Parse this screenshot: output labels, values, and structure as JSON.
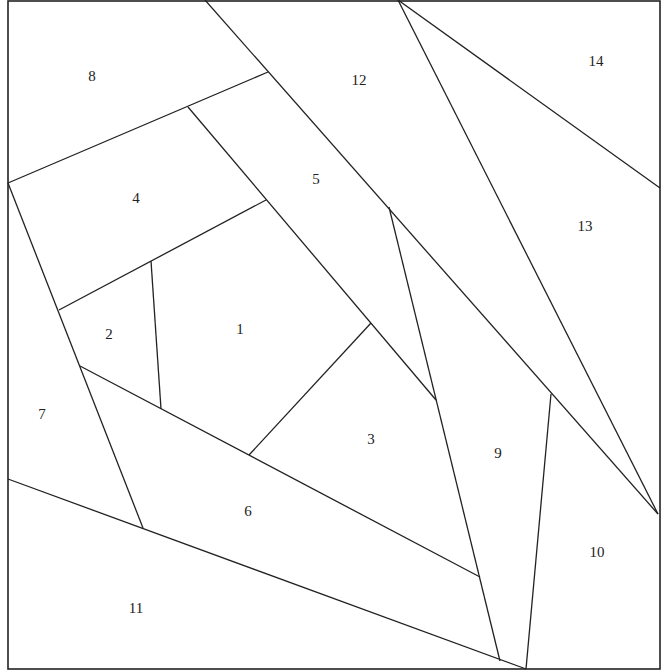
{
  "diagram": {
    "line_color": "#222222",
    "background": "#ffffff",
    "pieces": [
      {
        "id": "1",
        "label": "1"
      },
      {
        "id": "2",
        "label": "2"
      },
      {
        "id": "3",
        "label": "3"
      },
      {
        "id": "4",
        "label": "4"
      },
      {
        "id": "5",
        "label": "5"
      },
      {
        "id": "6",
        "label": "6"
      },
      {
        "id": "7",
        "label": "7"
      },
      {
        "id": "8",
        "label": "8"
      },
      {
        "id": "9",
        "label": "9"
      },
      {
        "id": "10",
        "label": "10"
      },
      {
        "id": "11",
        "label": "11"
      },
      {
        "id": "12",
        "label": "12"
      },
      {
        "id": "13",
        "label": "13"
      },
      {
        "id": "14",
        "label": "14"
      }
    ]
  }
}
